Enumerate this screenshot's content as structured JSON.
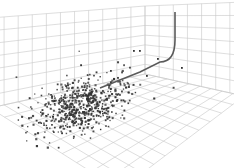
{
  "chart_data": {
    "type": "scatter",
    "title": "",
    "xlabel": "",
    "ylabel": "",
    "zlabel": "",
    "grid": true,
    "legend": null,
    "projection": "3d-perspective-room",
    "series": [
      {
        "name": "points",
        "kind": "scatter",
        "color": "#333333",
        "count_approx": 600,
        "distribution": "gaussian cluster on floor plane, denser at center",
        "center_px": [
          80,
          105
        ],
        "spread_px": [
          28,
          16
        ],
        "outliers_px": [
          [
            133,
            50
          ],
          [
            139,
            50
          ],
          [
            157,
            58
          ],
          [
            181,
            67
          ],
          [
            146,
            75
          ],
          [
            110,
            70
          ]
        ]
      },
      {
        "name": "trajectory",
        "kind": "line",
        "color": "#555555",
        "path_px": [
          [
            175,
            12
          ],
          [
            175,
            40
          ],
          [
            172,
            50
          ],
          [
            160,
            62
          ],
          [
            140,
            72
          ],
          [
            120,
            80
          ],
          [
            100,
            88
          ]
        ]
      }
    ]
  },
  "colors": {
    "background": "#ffffff",
    "grid": "#c8c8c8",
    "points": "#333333",
    "line": "#5a5a5a"
  }
}
